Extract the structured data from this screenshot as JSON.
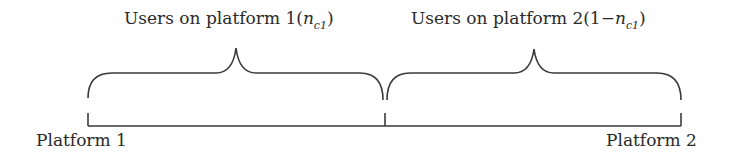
{
  "diagram": {
    "type": "hotelling-line-two-platforms",
    "top_labels": [
      {
        "prefix": "Users on platform 1(",
        "var": "n",
        "sub": "c1",
        "suffix": ")"
      },
      {
        "prefix": "Users on platform 2(1−",
        "var": "n",
        "sub": "c1",
        "suffix": ")"
      }
    ],
    "endpoints": {
      "left": "Platform 1",
      "right": "Platform 2"
    },
    "stroke_color": "#3a3a3a",
    "text_color": "#2a2a2a"
  }
}
